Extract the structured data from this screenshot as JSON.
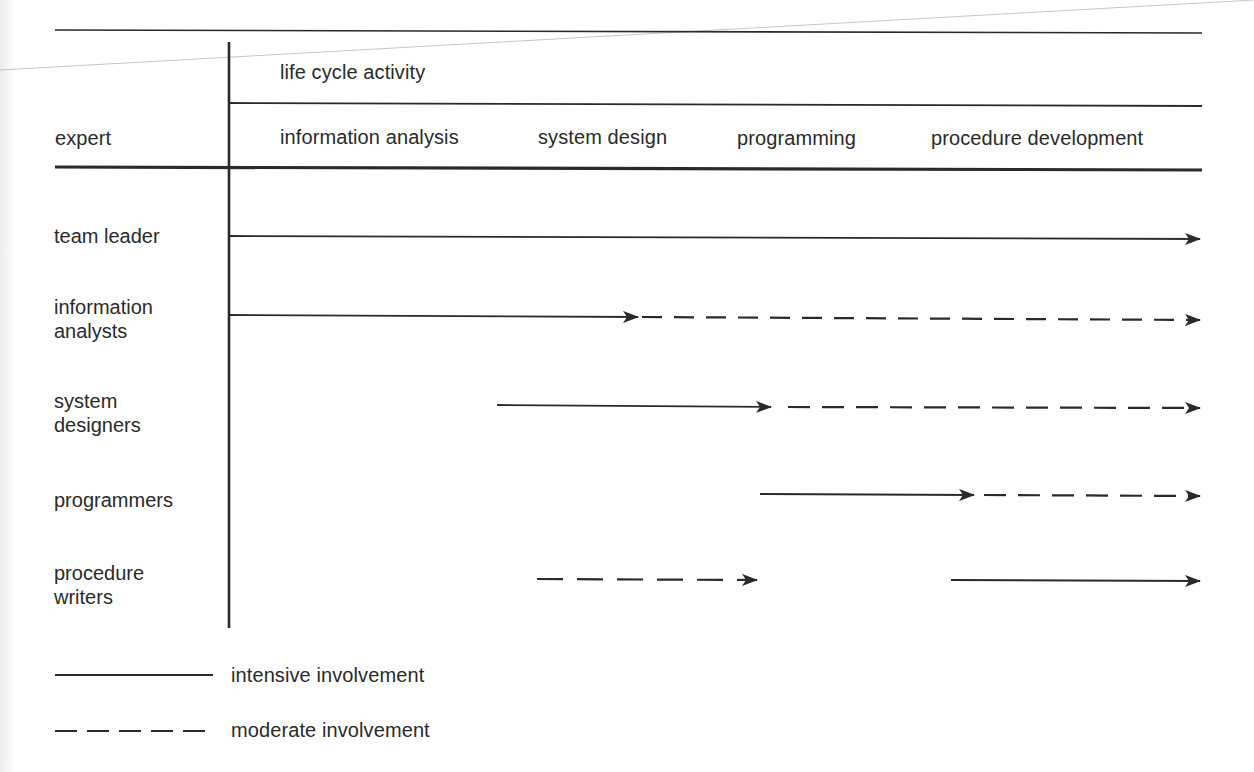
{
  "figure": {
    "row_header": "expert",
    "column_group_header": "life cycle activity",
    "columns": [
      "information analysis",
      "system design",
      "programming",
      "procedure development"
    ],
    "rows": [
      {
        "label_line1": "team leader",
        "label_line2": "",
        "segments": [
          {
            "type": "intensive",
            "x_start": 230,
            "x_end": 1200
          }
        ]
      },
      {
        "label_line1": "information",
        "label_line2": "analysts",
        "segments": [
          {
            "type": "intensive",
            "x_start": 230,
            "x_end": 640
          },
          {
            "type": "moderate",
            "x_start": 642,
            "x_end": 1200
          }
        ]
      },
      {
        "label_line1": "system",
        "label_line2": "designers",
        "segments": [
          {
            "type": "intensive",
            "x_start": 497,
            "x_end": 771
          },
          {
            "type": "moderate",
            "x_start": 788,
            "x_end": 1200
          }
        ]
      },
      {
        "label_line1": "programmers",
        "label_line2": "",
        "segments": [
          {
            "type": "intensive",
            "x_start": 760,
            "x_end": 974
          },
          {
            "type": "moderate",
            "x_start": 984,
            "x_end": 1200
          }
        ]
      },
      {
        "label_line1": "procedure",
        "label_line2": "writers",
        "segments": [
          {
            "type": "moderate",
            "x_start": 537,
            "x_end": 757
          },
          {
            "type": "intensive",
            "x_start": 951,
            "x_end": 1200
          }
        ]
      }
    ],
    "legend": [
      {
        "type": "intensive",
        "label": "intensive involvement"
      },
      {
        "type": "moderate",
        "label": "moderate involvement"
      }
    ],
    "colors": {
      "ink": "#2a2a2a",
      "paper": "#ffffff"
    }
  }
}
